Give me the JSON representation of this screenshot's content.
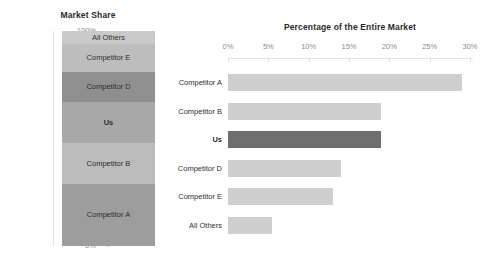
{
  "chart_data": [
    {
      "type": "bar",
      "subtype": "stacked-100-column",
      "title": "Market Share",
      "xlabel": "",
      "ylabel": "",
      "ylim": [
        0,
        100
      ],
      "grid": false,
      "legend": "none",
      "categories": [
        "Competitor A",
        "Competitor B",
        "Us",
        "Competitor D",
        "Competitor E",
        "All Others"
      ],
      "values": [
        29,
        19,
        19,
        14,
        13,
        6
      ],
      "stack_order_bottom_to_top": [
        "Competitor A",
        "Competitor B",
        "Us",
        "Competitor D",
        "Competitor E",
        "All Others"
      ],
      "ytick_labels": [
        "0%",
        "20%",
        "40%",
        "60%",
        "80%",
        "100%"
      ],
      "ytick_values": [
        0,
        20,
        40,
        60,
        80,
        100
      ],
      "segments": [
        {
          "label": "All Others",
          "value": 6,
          "start": 94,
          "end": 100,
          "color": "#c9c9c9",
          "highlight": false
        },
        {
          "label": "Competitor E",
          "value": 13,
          "start": 81,
          "end": 94,
          "color": "#bdbdbd",
          "highlight": false
        },
        {
          "label": "Competitor D",
          "value": 14,
          "start": 67,
          "end": 81,
          "color": "#8f8f8f",
          "highlight": false
        },
        {
          "label": "Us",
          "value": 19,
          "start": 48,
          "end": 67,
          "color": "#a8a8a8",
          "highlight": true
        },
        {
          "label": "Competitor B",
          "value": 19,
          "start": 29,
          "end": 48,
          "color": "#bcbcbc",
          "highlight": false
        },
        {
          "label": "Competitor A",
          "value": 29,
          "start": 0,
          "end": 29,
          "color": "#9d9d9d",
          "highlight": false
        }
      ]
    },
    {
      "type": "bar",
      "subtype": "horizontal-bar",
      "title": "Percentage of the Entire Market",
      "xlabel": "",
      "ylabel": "",
      "xlim": [
        0,
        30
      ],
      "grid": false,
      "legend": "none",
      "categories": [
        "Competitor A",
        "Competitor B",
        "Us",
        "Competitor D",
        "Competitor E",
        "All Others"
      ],
      "values": [
        29,
        19,
        19,
        14,
        13,
        5.5
      ],
      "xtick_labels": [
        "0%",
        "5%",
        "10%",
        "15%",
        "20%",
        "25%",
        "30%"
      ],
      "xtick_values": [
        0,
        5,
        10,
        15,
        20,
        25,
        30
      ],
      "bars": [
        {
          "label": "Competitor A",
          "value": 29,
          "color": "#cfcfcf",
          "highlight": false
        },
        {
          "label": "Competitor B",
          "value": 19,
          "color": "#cfcfcf",
          "highlight": false
        },
        {
          "label": "Us",
          "value": 19,
          "color": "#6e6e6e",
          "highlight": true
        },
        {
          "label": "Competitor D",
          "value": 14,
          "color": "#cfcfcf",
          "highlight": false
        },
        {
          "label": "Competitor E",
          "value": 13,
          "color": "#cfcfcf",
          "highlight": false
        },
        {
          "label": "All Others",
          "value": 5.5,
          "color": "#cfcfcf",
          "highlight": false
        }
      ]
    }
  ],
  "colors": {
    "background": "#ffffff",
    "axis_line": "#e2e2e2",
    "tick_label": "#8d8d8d",
    "title_text": "#2b2b2b",
    "bar_default": "#cfcfcf",
    "bar_highlight": "#6e6e6e"
  }
}
